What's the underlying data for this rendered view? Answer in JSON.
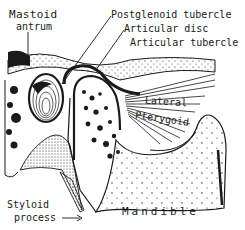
{
  "figure": {
    "colors": {
      "ink": "#1a1a1a",
      "background": "#ffffff"
    },
    "labels": {
      "mastoid": "Mastoid",
      "antrum": "antrum",
      "postglenoid_tubercle": "Postglenoid tubercle",
      "articular_disc": "Articular disc",
      "articular_tubercle": "Articular tubercle",
      "lateral": "Lateral",
      "pterygoid": "Pterygoid",
      "styloid": "Styloid",
      "process": "process",
      "mandible": "Mandible"
    }
  }
}
